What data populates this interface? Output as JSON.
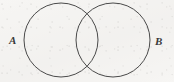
{
  "figure": {
    "kind": "venn-diagram",
    "width": 174,
    "height": 82,
    "background_color": "#f7f6f4",
    "stroke_color": "#4a4a4a",
    "stroke_width": 1,
    "fill": "none"
  },
  "labels": {
    "left": "A",
    "right": "B"
  },
  "sets": [
    {
      "name": "A",
      "label": "A",
      "label_position": "outside-left",
      "center_x": 61,
      "center_y": 40,
      "radius": 37
    },
    {
      "name": "B",
      "label": "B",
      "label_position": "outside-right",
      "center_x": 113,
      "center_y": 40,
      "radius": 37
    }
  ],
  "intersection": {
    "shaded": false,
    "center_x": 87,
    "upper_crossing_y": 14,
    "lower_crossing_y": 66
  }
}
